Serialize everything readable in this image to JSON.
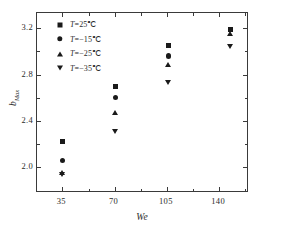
{
  "chart_data": {
    "type": "scatter",
    "title": "",
    "xlabel": "We",
    "ylabel": "b",
    "ylabel_sub": "Max",
    "xlim": [
      18,
      160
    ],
    "ylim": [
      1.78,
      3.33
    ],
    "xticks": [
      "35",
      "70",
      "105",
      "140"
    ],
    "xtick_values": [
      35,
      70,
      105,
      140
    ],
    "yticks": [
      "2.0",
      "2.4",
      "2.8",
      "3.2"
    ],
    "ytick_values": [
      2.0,
      2.4,
      2.8,
      3.2
    ],
    "grid": false,
    "legend_position": "top-left inside",
    "x": [
      35,
      70.5,
      106,
      147.5
    ],
    "series": [
      {
        "name": "T=25℃",
        "marker": "square",
        "color": "#1a1a1a",
        "values": [
          2.22,
          2.7,
          3.05,
          3.19
        ]
      },
      {
        "name": "T=−15℃",
        "marker": "circle",
        "color": "#1a1a1a",
        "values": [
          2.06,
          2.6,
          2.96,
          3.19
        ]
      },
      {
        "name": "T=−25℃",
        "marker": "triangle-up",
        "color": "#1a1a1a",
        "values": [
          1.955,
          2.47,
          2.88,
          3.15
        ]
      },
      {
        "name": "T=−35℃",
        "marker": "triangle-down",
        "color": "#1a1a1a",
        "values": [
          1.94,
          2.31,
          2.73,
          3.04
        ]
      }
    ]
  },
  "legend": {
    "entries": [
      {
        "label": "T=25℃",
        "marker": "square"
      },
      {
        "label": "T=−15℃",
        "marker": "circle"
      },
      {
        "label": "T=−25℃",
        "marker": "triangle-up"
      },
      {
        "label": "T=−35℃",
        "marker": "triangle-down"
      }
    ]
  },
  "axes": {
    "x_title": "We",
    "y_title_base": "b",
    "y_title_sub": "Max"
  }
}
